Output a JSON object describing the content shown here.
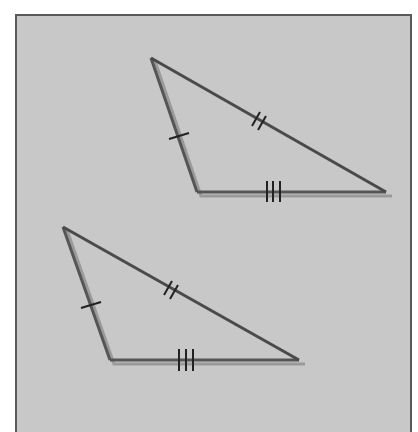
{
  "figure": {
    "title": "",
    "colors": {
      "background": "#c8c8c8",
      "frame_border": "#5a5a5a",
      "line": "#555555",
      "shadow_line": "#9a9a9a",
      "tick": "#222222"
    },
    "triangles": [
      {
        "name": "triangle-top",
        "vertices": [
          [
            151,
            58
          ],
          [
            197,
            192
          ],
          [
            386,
            192
          ]
        ],
        "ticks": {
          "short_side": 1,
          "long_side": 2,
          "base": 3
        }
      },
      {
        "name": "triangle-bottom",
        "vertices": [
          [
            63,
            227
          ],
          [
            110,
            360
          ],
          [
            299,
            360
          ]
        ],
        "ticks": {
          "short_side": 1,
          "long_side": 2,
          "base": 3
        }
      }
    ]
  }
}
